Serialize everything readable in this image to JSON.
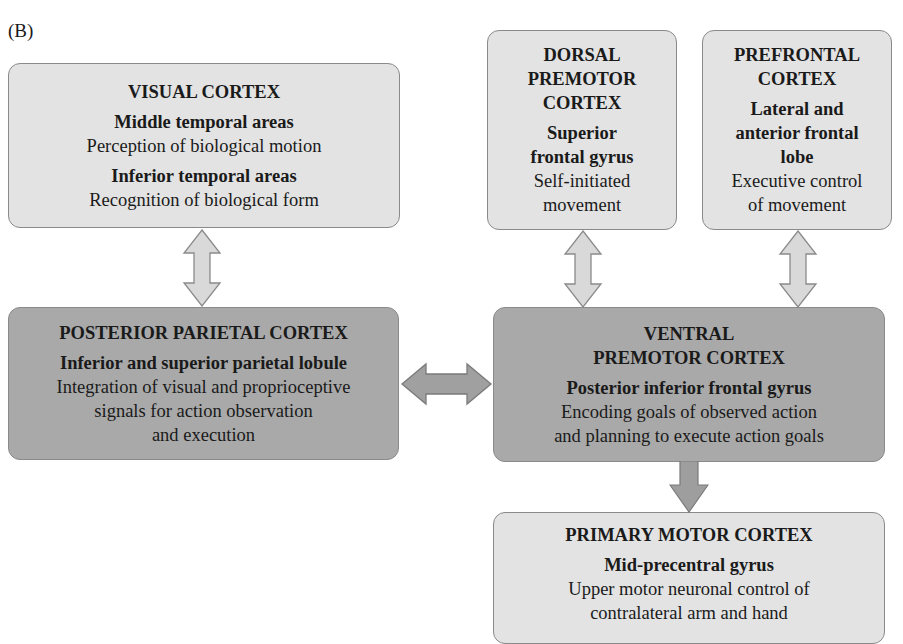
{
  "panel_label": "(B)",
  "colors": {
    "light_box": "#e3e3e3",
    "dark_box": "#a9a9a9",
    "border": "#8a8a8a",
    "arrow_fill": "#d6d6d6",
    "arrow_dark_fill": "#9c9c9c"
  },
  "boxes": {
    "visual": {
      "title": "VISUAL CORTEX",
      "region1": "Middle temporal areas",
      "desc1": "Perception of biological motion",
      "region2": "Inferior temporal areas",
      "desc2": "Recognition of biological form"
    },
    "dorsal": {
      "title_lines": [
        "DORSAL",
        "PREMOTOR",
        "CORTEX"
      ],
      "region_lines": [
        "Superior",
        "frontal gyrus"
      ],
      "desc_lines": [
        "Self-initiated",
        "movement"
      ]
    },
    "prefrontal": {
      "title_lines": [
        "PREFRONTAL",
        "CORTEX"
      ],
      "region_lines": [
        "Lateral and",
        "anterior frontal",
        "lobe"
      ],
      "desc_lines": [
        "Executive control",
        "of movement"
      ]
    },
    "parietal": {
      "title": "POSTERIOR PARIETAL CORTEX",
      "region": "Inferior and superior parietal lobule",
      "desc_lines": [
        "Integration of visual and proprioceptive",
        "signals for action observation",
        "and execution"
      ]
    },
    "ventral": {
      "title_lines": [
        "VENTRAL",
        "PREMOTOR CORTEX"
      ],
      "region": "Posterior inferior frontal gyrus",
      "desc_lines": [
        "Encoding goals of observed action",
        "and planning to execute action goals"
      ]
    },
    "primary": {
      "title": "PRIMARY MOTOR CORTEX",
      "region": "Mid-precentral gyrus",
      "desc_lines": [
        "Upper motor neuronal control of",
        "contralateral arm and hand"
      ]
    }
  },
  "connections": [
    {
      "from": "VISUAL CORTEX",
      "to": "POSTERIOR PARIETAL CORTEX",
      "type": "bidirectional"
    },
    {
      "from": "DORSAL PREMOTOR CORTEX",
      "to": "VENTRAL PREMOTOR CORTEX",
      "type": "bidirectional"
    },
    {
      "from": "PREFRONTAL CORTEX",
      "to": "VENTRAL PREMOTOR CORTEX",
      "type": "bidirectional"
    },
    {
      "from": "POSTERIOR PARIETAL CORTEX",
      "to": "VENTRAL PREMOTOR CORTEX",
      "type": "bidirectional"
    },
    {
      "from": "VENTRAL PREMOTOR CORTEX",
      "to": "PRIMARY MOTOR CORTEX",
      "type": "unidirectional"
    }
  ]
}
